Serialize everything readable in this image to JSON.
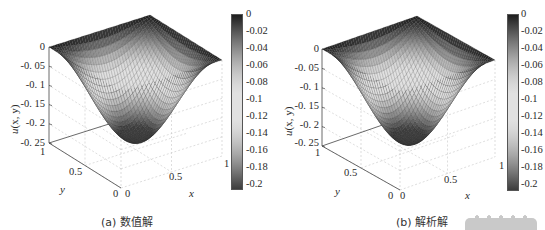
{
  "chart_data": [
    {
      "type": "surface",
      "title": "",
      "caption": "(a) 数值解",
      "xlabel": "x",
      "ylabel": "y",
      "zlabel": "u(x, y)",
      "x_ticks": [
        "0",
        "0.5",
        "1"
      ],
      "y_ticks": [
        "0",
        "0.5",
        "1"
      ],
      "z_ticks": [
        "0",
        "-0. 05",
        "-0. 1",
        "-0. 15",
        "-0. 2",
        "-0. 25"
      ],
      "xlim": [
        0,
        1
      ],
      "ylim": [
        0,
        1
      ],
      "zlim": [
        -0.25,
        0
      ],
      "colorbar": {
        "ticks": [
          "0",
          "-0.02",
          "-0.04",
          "-0.06",
          "-0.08",
          "-0.1",
          "-0.12",
          "-0.14",
          "-0.16",
          "-0.18",
          "-0.2"
        ],
        "range": [
          -0.21,
          0
        ],
        "colormap": "gray (dark–light–dark)"
      },
      "surface": {
        "function": "bowl, zero on boundary, minimum at center",
        "min_value": -0.23,
        "min_location": [
          0.5,
          0.5
        ],
        "boundary_value": 0
      },
      "grid": true
    },
    {
      "type": "surface",
      "title": "",
      "caption": "(b) 解析解",
      "xlabel": "x",
      "ylabel": "y",
      "zlabel": "u(x, y)",
      "x_ticks": [
        "0",
        "0.5",
        "1"
      ],
      "y_ticks": [
        "0",
        "0.5",
        "1"
      ],
      "z_ticks": [
        "0",
        "-0. 05",
        "-0. 1",
        "-0. 15",
        "-0. 2",
        "-0. 25"
      ],
      "xlim": [
        0,
        1
      ],
      "ylim": [
        0,
        1
      ],
      "zlim": [
        -0.25,
        0
      ],
      "colorbar": {
        "ticks": [
          "0",
          "-0.02",
          "-0.04",
          "-0.06",
          "-0.08",
          "-0.1",
          "-0.12",
          "-0.14",
          "-0.16",
          "-0.18",
          "-0.2"
        ],
        "range": [
          -0.21,
          0
        ],
        "colormap": "gray (dark–light–dark)"
      },
      "surface": {
        "function": "bowl, zero on boundary, minimum at center",
        "min_value": -0.23,
        "min_location": [
          0.5,
          0.5
        ],
        "boundary_value": 0
      },
      "grid": true
    }
  ],
  "panels": [
    {
      "caption": "(a) 数值解",
      "zlabel_u": "u",
      "zlabel_args": "(x, y)",
      "xlabel": "x",
      "ylabel": "y",
      "z_ticks": [
        "0",
        "-0. 05",
        "-0. 1",
        "-0. 15",
        "-0. 2",
        "-0. 25"
      ],
      "x_ticks": [
        "0",
        "0.5",
        "1"
      ],
      "y_ticks": [
        "0",
        "0.5",
        "1"
      ],
      "cb_ticks": [
        "0",
        "-0.02",
        "-0.04",
        "-0.06",
        "-0.08",
        "-0.1",
        "-0.12",
        "-0.14",
        "-0.16",
        "-0.18",
        "-0.2"
      ]
    },
    {
      "caption": "(b) 解析解",
      "zlabel_u": "u",
      "zlabel_args": "(x, y)",
      "xlabel": "x",
      "ylabel": "y",
      "z_ticks": [
        "0",
        "-0. 05",
        "-0. 1",
        "-0. 15",
        "-0. 2",
        "-0. 25"
      ],
      "x_ticks": [
        "0",
        "0.5",
        "1"
      ],
      "y_ticks": [
        "0",
        "0.5",
        "1"
      ],
      "cb_ticks": [
        "0",
        "-0.02",
        "-0.04",
        "-0.06",
        "-0.08",
        "-0.1",
        "-0.12",
        "-0.14",
        "-0.16",
        "-0.18",
        "-0.2"
      ]
    }
  ],
  "colors": {
    "surface_dark": "#1a1a1a",
    "surface_light": "#d8d8d8",
    "grid": "#c8c8c8",
    "axis": "#444444"
  }
}
